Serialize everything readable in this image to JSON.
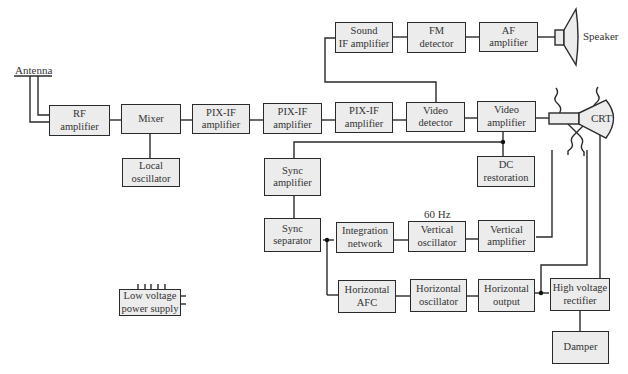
{
  "diagram": {
    "title": "",
    "blocks": {
      "rf_amp": [
        "RF",
        "amplifier"
      ],
      "mixer": [
        "Mixer"
      ],
      "local_osc": [
        "Local",
        "oscillator"
      ],
      "pixif1": [
        "PIX-IF",
        "amplifier"
      ],
      "pixif2": [
        "PIX-IF",
        "amplifier"
      ],
      "pixif3": [
        "PIX-IF",
        "amplifier"
      ],
      "video_det": [
        "Video",
        "detector"
      ],
      "video_amp": [
        "Video",
        "amplifier"
      ],
      "sound_if": [
        "Sound",
        "IF amplifier"
      ],
      "fm_det": [
        "FM",
        "detector"
      ],
      "af_amp": [
        "AF",
        "amplifier"
      ],
      "dc_rest": [
        "DC",
        "restoration"
      ],
      "sync_amp": [
        "Sync",
        "amplifier"
      ],
      "sync_sep": [
        "Sync",
        "separator"
      ],
      "integ": [
        "Integration",
        "network"
      ],
      "vert_osc": [
        "Vertical",
        "oscillator"
      ],
      "vert_amp": [
        "Vertical",
        "amplifier"
      ],
      "horiz_afc": [
        "Horizontal",
        "AFC"
      ],
      "horiz_osc": [
        "Horizontal",
        "oscillator"
      ],
      "horiz_out": [
        "Horizontal",
        "output"
      ],
      "hv_rect": [
        "High voltage",
        "rectifier"
      ],
      "damper": [
        "Damper"
      ],
      "lv_supply": [
        "Low voltage",
        "power supply"
      ]
    },
    "labels": {
      "antenna": "Antenna",
      "speaker": "Speaker",
      "crt": "CRT",
      "freq": "60 Hz"
    },
    "edges": [
      [
        "Antenna",
        "RF amplifier"
      ],
      [
        "RF amplifier",
        "Mixer"
      ],
      [
        "Local oscillator",
        "Mixer"
      ],
      [
        "Mixer",
        "PIX-IF amplifier 1"
      ],
      [
        "PIX-IF amplifier 1",
        "PIX-IF amplifier 2"
      ],
      [
        "PIX-IF amplifier 2",
        "PIX-IF amplifier 3"
      ],
      [
        "PIX-IF amplifier 3",
        "Video detector"
      ],
      [
        "Video detector",
        "Video amplifier"
      ],
      [
        "Video detector",
        "Sound IF amplifier"
      ],
      [
        "Sound IF amplifier",
        "FM detector"
      ],
      [
        "FM detector",
        "AF amplifier"
      ],
      [
        "AF amplifier",
        "Speaker"
      ],
      [
        "Video amplifier",
        "CRT"
      ],
      [
        "Video amplifier",
        "DC restoration"
      ],
      [
        "Video amplifier",
        "Sync amplifier"
      ],
      [
        "Sync amplifier",
        "Sync separator"
      ],
      [
        "Sync separator",
        "Integration network"
      ],
      [
        "Integration network",
        "Vertical oscillator"
      ],
      [
        "Vertical oscillator",
        "Vertical amplifier"
      ],
      [
        "Vertical amplifier",
        "CRT deflection"
      ],
      [
        "Sync separator",
        "Horizontal AFC"
      ],
      [
        "Horizontal AFC",
        "Horizontal oscillator"
      ],
      [
        "Horizontal oscillator",
        "Horizontal output"
      ],
      [
        "Horizontal output",
        "High voltage rectifier"
      ],
      [
        "Horizontal output",
        "CRT deflection"
      ],
      [
        "High voltage rectifier",
        "CRT"
      ],
      [
        "High voltage rectifier",
        "Damper"
      ]
    ]
  }
}
